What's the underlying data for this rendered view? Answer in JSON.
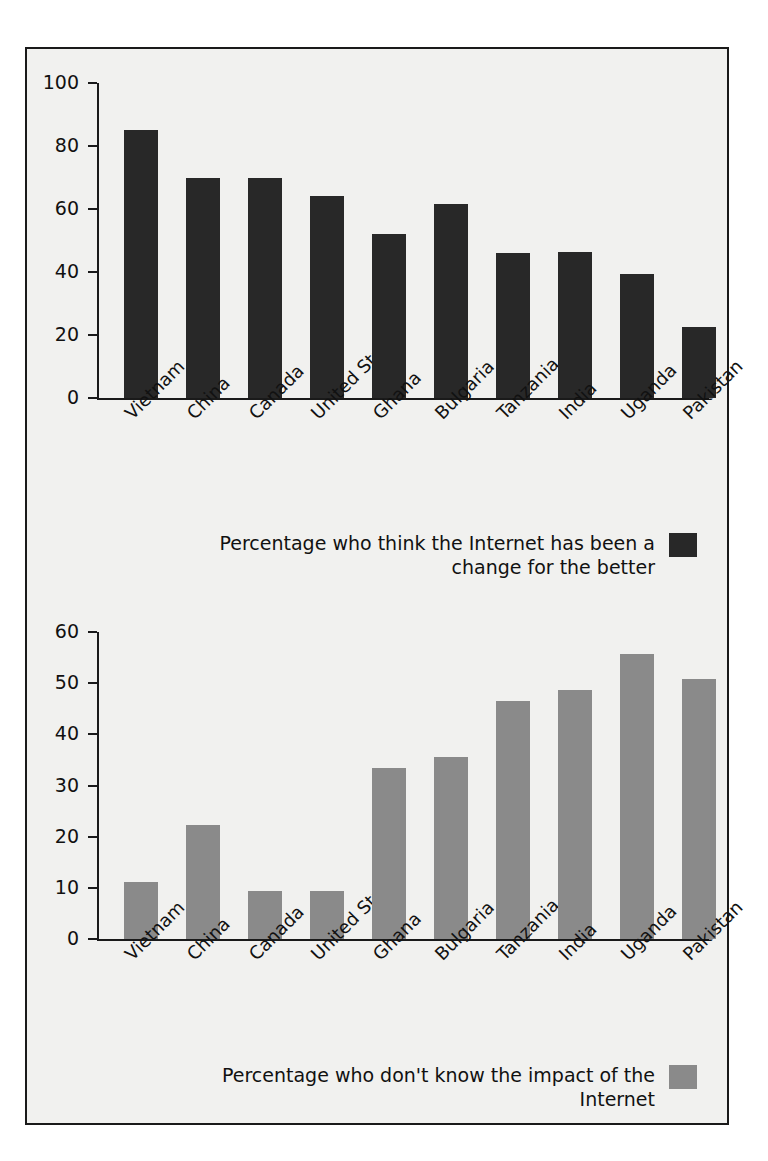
{
  "figure": {
    "background_color": "#f1f1ef",
    "border_color": "#1a1a1a"
  },
  "chart_data": [
    {
      "type": "bar",
      "id": "internet-change-for-the-better",
      "title": "",
      "xlabel": "",
      "ylabel": "",
      "ylim": [
        0,
        100
      ],
      "yticks": [
        0,
        20,
        40,
        60,
        80,
        100
      ],
      "ytick_labels": [
        "0",
        "20",
        "40",
        "60",
        "80",
        "100"
      ],
      "grid": false,
      "legend_position": "bottom-right",
      "legend": "Percentage who think the Internet has been a change for the better",
      "legend_line_1": "Percentage who think the Internet has been a",
      "legend_line_2": "change for the better",
      "bar_color": "#282828",
      "categories": [
        "Vietnam",
        "China",
        "Canada",
        "United States",
        "Ghana",
        "Bulgaria",
        "Tanzania",
        "India",
        "Uganda",
        "Pakistan"
      ],
      "values": [
        85,
        70,
        70,
        64,
        52,
        61.5,
        46,
        46.5,
        39.5,
        22.5
      ]
    },
    {
      "type": "bar",
      "id": "internet-dont-know-impact",
      "title": "",
      "xlabel": "",
      "ylabel": "",
      "ylim": [
        0,
        60
      ],
      "yticks": [
        0,
        10,
        20,
        30,
        40,
        50,
        60
      ],
      "ytick_labels": [
        "0",
        "10",
        "20",
        "30",
        "40",
        "50",
        "60"
      ],
      "grid": false,
      "legend_position": "bottom-right",
      "legend": "Percentage who don't know the impact of the Internet",
      "legend_line_1": "Percentage who don't know the impact of the Internet",
      "bar_color": "#8a8a8a",
      "categories": [
        "Vietnam",
        "China",
        "Canada",
        "United States",
        "Ghana",
        "Bulgaria",
        "Tanzania",
        "India",
        "Uganda",
        "Pakistan"
      ],
      "values": [
        11.2,
        22.3,
        9.4,
        9.4,
        33.5,
        35.5,
        46.6,
        48.7,
        55.8,
        50.9
      ]
    }
  ]
}
